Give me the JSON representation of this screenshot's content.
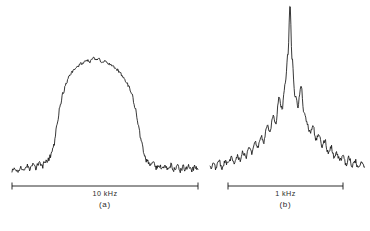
{
  "figure": {
    "background": "#ffffff",
    "ink_color": "#141414",
    "panels": [
      {
        "id": "a",
        "panel_label": "(a)",
        "scale_bar_label": "10 kHz",
        "scale_bar": {
          "x_start": 12,
          "x_end": 198,
          "y": 186
        }
      },
      {
        "id": "b",
        "panel_label": "(b)",
        "scale_bar_label": "1 kHz",
        "scale_bar": {
          "x_start": 228,
          "x_end": 343,
          "y": 186
        }
      }
    ]
  },
  "chart_data": [
    {
      "type": "line",
      "id": "spectrum-a",
      "title": "",
      "xlabel": "",
      "ylabel": "",
      "annotations": [
        "10 kHz",
        "(a)"
      ],
      "axis": {
        "grid": false,
        "legend": false,
        "frame": false
      },
      "scale_bar": {
        "span_label": "10 kHz",
        "x_start": 12,
        "x_end": 198
      },
      "xlim": [
        12,
        198
      ],
      "ylim": [
        0,
        1
      ],
      "description": "Broad flat-topped (super-Gaussian) resonance line with noise, steep edges, flat noisy baseline on both sides",
      "baseline_level": 0.03,
      "peak_level": 1.0,
      "x": [
        12,
        15,
        18,
        21,
        24,
        27,
        30,
        33,
        36,
        39,
        42,
        45,
        48,
        51,
        54,
        57,
        60,
        63,
        66,
        69,
        72,
        75,
        78,
        81,
        84,
        87,
        90,
        93,
        96,
        99,
        102,
        105,
        108,
        111,
        114,
        117,
        120,
        123,
        126,
        129,
        132,
        135,
        138,
        141,
        144,
        147,
        150,
        153,
        156,
        159,
        162,
        165,
        168,
        171,
        174,
        177,
        180,
        183,
        186,
        189,
        192,
        195,
        198
      ],
      "y": [
        0.02,
        0.05,
        0.02,
        0.06,
        0.03,
        0.07,
        0.04,
        0.08,
        0.05,
        0.09,
        0.06,
        0.1,
        0.12,
        0.16,
        0.26,
        0.42,
        0.58,
        0.7,
        0.78,
        0.84,
        0.88,
        0.9,
        0.93,
        0.95,
        0.96,
        0.98,
        0.97,
        1.0,
        0.98,
        0.99,
        0.96,
        0.97,
        0.95,
        0.94,
        0.92,
        0.9,
        0.87,
        0.84,
        0.8,
        0.75,
        0.68,
        0.58,
        0.44,
        0.3,
        0.18,
        0.11,
        0.07,
        0.09,
        0.05,
        0.08,
        0.04,
        0.07,
        0.05,
        0.08,
        0.04,
        0.07,
        0.03,
        0.06,
        0.04,
        0.07,
        0.03,
        0.06,
        0.04
      ]
    },
    {
      "type": "line",
      "id": "spectrum-b",
      "title": "",
      "xlabel": "",
      "ylabel": "",
      "annotations": [
        "1 kHz",
        "(b)"
      ],
      "axis": {
        "grid": false,
        "legend": false,
        "frame": false
      },
      "scale_bar": {
        "span_label": "1 kHz",
        "x_start": 228,
        "x_end": 343
      },
      "xlim": [
        210,
        365
      ],
      "ylim": [
        0,
        1
      ],
      "description": "Narrow tall central spike with symmetric side lobes on a broad noisy pedestal decaying to baseline",
      "baseline_level": 0.03,
      "peak_level": 1.0,
      "x": [
        210,
        213,
        216,
        219,
        222,
        225,
        228,
        231,
        234,
        237,
        240,
        243,
        246,
        249,
        252,
        255,
        258,
        261,
        264,
        267,
        270,
        273,
        276,
        279,
        282,
        285,
        288,
        290,
        292,
        295,
        298,
        301,
        304,
        307,
        310,
        313,
        316,
        319,
        322,
        325,
        328,
        331,
        334,
        337,
        340,
        343,
        346,
        349,
        352,
        355,
        358,
        361,
        364
      ],
      "y": [
        0.03,
        0.06,
        0.03,
        0.07,
        0.04,
        0.08,
        0.05,
        0.09,
        0.06,
        0.11,
        0.08,
        0.13,
        0.1,
        0.15,
        0.12,
        0.18,
        0.15,
        0.22,
        0.19,
        0.28,
        0.24,
        0.34,
        0.3,
        0.45,
        0.38,
        0.52,
        0.7,
        1.0,
        0.68,
        0.46,
        0.4,
        0.52,
        0.36,
        0.3,
        0.24,
        0.28,
        0.2,
        0.24,
        0.16,
        0.19,
        0.13,
        0.16,
        0.1,
        0.12,
        0.08,
        0.1,
        0.06,
        0.09,
        0.05,
        0.08,
        0.04,
        0.07,
        0.04
      ]
    }
  ]
}
